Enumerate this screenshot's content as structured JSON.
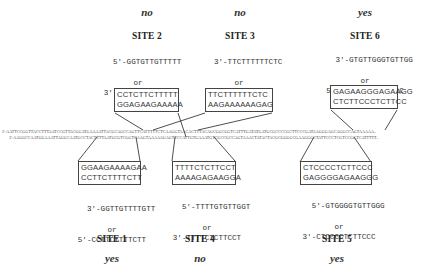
{
  "figure": {
    "dna": {
      "top_strand": "5'-AATTCCGGTTACCTTTAATCCGTTACGGATGAAAATTACGCAGCCAGTTCATTTTTCTCAAGGTAACACTTTACAGCGGCGGTCATTTGATATGATGCGCCCCGCTTCCCGATAAGGGAGCAGGCCAGTAAAAA..",
      "bottom_strand": "3'-AAGGCCAATGGAAATTAGGCAATGCCTACTTTTAATGCGTCGGTCAAGTAAAAAGAGTTCCATTGTGAAATGTCGCCGCCAGTAAACTATACTACGCGGGGCGAAGGGCTATTCCCTCGTCCGGTCATTTTT.."
    },
    "sites": [
      {
        "id": "site-2",
        "position": "top",
        "verdict": "no",
        "label": "SITE 2",
        "oligo_line1": "5'-GGTGTTGTTTTT",
        "or": "or",
        "oligo_line2": "3'-CCTCTTCTTTTT",
        "box_line1": "CCTCTTCTTTTT",
        "box_line2": "GGAGAAGAAAAA"
      },
      {
        "id": "site-3",
        "position": "top",
        "verdict": "no",
        "label": "SITE 3",
        "oligo_line1": "3'-TTCTTTTTTCTC",
        "or": "or",
        "oligo_line2": "5'-TTGTTTTTTGTG",
        "box_line1": "TTCTTTTTTCTC",
        "box_line2": "AAGAAAAAAGAG"
      },
      {
        "id": "site-6",
        "position": "top",
        "verdict": "yes",
        "label": "SITE 6",
        "oligo_line1": "3'-GTGTTGGGTGTTGG",
        "or": "or",
        "oligo_line2": "5'-CTCTTCCCTCTTCC",
        "box_line1": "GAGAAGGGAGAAGG",
        "box_line2": "CTCTTCCCTCTTCC"
      },
      {
        "id": "site-1",
        "position": "bottom",
        "verdict": "yes",
        "label": "SITE 1",
        "oligo_line1": "3'-GGTTGTTTTGTT",
        "or": "or",
        "oligo_line2": "5'-CCTTCTTTTCTT",
        "box_line1": "GGAAGAAAAGAA",
        "box_line2": "CCTTCTTTTCTT"
      },
      {
        "id": "site-4",
        "position": "bottom",
        "verdict": "no",
        "label": "SITE 4",
        "oligo_line1": "5'-TTTTGTGTTGGT",
        "or": "or",
        "oligo_line2": "3'-TTTTCTCTTCCT",
        "box_line1": "TTTTCTCTTCCT",
        "box_line2": "AAAAGAGAAGGA"
      },
      {
        "id": "site-5",
        "position": "bottom",
        "verdict": "yes",
        "label": "SITE 5",
        "oligo_line1": "5'-GTGGGGTGTTGGG",
        "or": "or",
        "oligo_line2": "3'-CTCCCCTCTTCCC",
        "box_line1": "CTCCCCTCTTCCC",
        "box_line2": "GAGGGGAGAAGGG"
      }
    ],
    "colors": {
      "text": "#333333",
      "lines": "#222222",
      "box_border": "#444444",
      "background": "#ffffff"
    }
  }
}
